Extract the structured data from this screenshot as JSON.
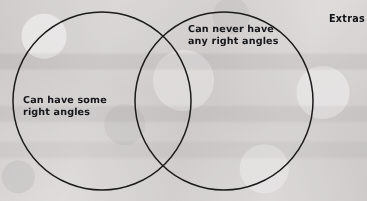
{
  "diagram": {
    "type": "venn",
    "title_label": "Extras",
    "background_color": "#eceaea",
    "stroke_color": "#1b1b1b",
    "text_color": "#15161a",
    "sets": [
      {
        "id": "left",
        "name": "left-circle",
        "label": "Can have some\nright angles",
        "label_line_1": "Can have some",
        "label_line_2": "right angles",
        "center_x": 102,
        "center_y": 101,
        "radius": 89
      },
      {
        "id": "right",
        "name": "right-circle",
        "label": "Can never have\nany right angles",
        "label_line_1": "Can never have",
        "label_line_2": "any right angles",
        "center_x": 224,
        "center_y": 101,
        "radius": 89
      }
    ],
    "intersection": {
      "name": "overlap-region",
      "label": "",
      "top_point_x": 165,
      "top_point_y": 29,
      "bottom_point_x": 165,
      "bottom_point_y": 172
    },
    "extras": {
      "label": "Extras"
    }
  }
}
